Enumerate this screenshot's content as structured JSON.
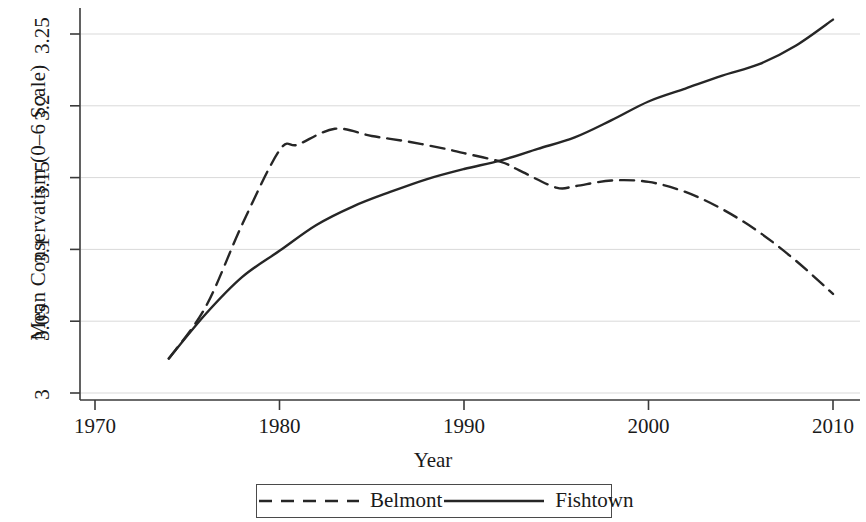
{
  "chart_data": {
    "type": "line",
    "title": "",
    "xlabel": "Year",
    "ylabel": "Mean Conservatism (0–6 Scale)",
    "xlim": [
      1968,
      2012
    ],
    "ylim": [
      3.0,
      3.268
    ],
    "xticks": [
      1970,
      1980,
      1990,
      2000,
      2010
    ],
    "xtick_labels": [
      "1970",
      "1980",
      "1990",
      "2000",
      "2010"
    ],
    "yticks": [
      3,
      3.05,
      3.1,
      3.15,
      3.2,
      3.25
    ],
    "ytick_labels": [
      "3",
      "3.05",
      "3.1",
      "3.15",
      "3.2",
      "3.25"
    ],
    "grid": "horizontal",
    "legend_position": "below-center",
    "series": [
      {
        "name": "Belmont",
        "style": "dashed",
        "color": "#262626",
        "x": [
          1974,
          1976,
          1978,
          1980,
          1981,
          1983,
          1985,
          1987,
          1989,
          1990,
          1992,
          1993,
          1995,
          1996,
          1998,
          2000,
          2002,
          2004,
          2006,
          2008,
          2010
        ],
        "y": [
          3.024,
          3.06,
          3.118,
          3.169,
          3.173,
          3.184,
          3.179,
          3.175,
          3.17,
          3.167,
          3.161,
          3.155,
          3.143,
          3.144,
          3.148,
          3.147,
          3.14,
          3.128,
          3.112,
          3.092,
          3.069
        ]
      },
      {
        "name": "Fishtown",
        "style": "solid",
        "color": "#262626",
        "x": [
          1974,
          1976,
          1978,
          1980,
          1982,
          1984,
          1986,
          1988,
          1990,
          1992,
          1994,
          1996,
          1998,
          2000,
          2002,
          2004,
          2006,
          2008,
          2010
        ],
        "y": [
          3.024,
          3.055,
          3.081,
          3.099,
          3.117,
          3.13,
          3.14,
          3.149,
          3.156,
          3.162,
          3.17,
          3.178,
          3.19,
          3.203,
          3.212,
          3.221,
          3.229,
          3.242,
          3.26
        ]
      }
    ]
  },
  "legend": {
    "items": [
      {
        "label": "Belmont",
        "style": "dashed"
      },
      {
        "label": "Fishtown",
        "style": "solid"
      }
    ]
  }
}
